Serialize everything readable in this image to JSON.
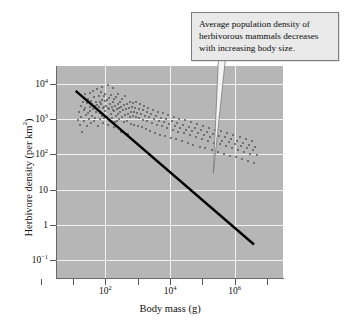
{
  "figure": {
    "background_color": "#ffffff",
    "plot_background_color": "#b6b6b6",
    "gridline_color": "#f2f2f2",
    "point_color": "#585858",
    "trendline_color": "#000000",
    "annotation_fill": "#e9e9e9",
    "annotation_border": "#7d7d7d"
  },
  "annotation": {
    "text": "Average population density of herbivorous mammals decreases with increasing body size.",
    "line1": "Average population density of",
    "line2": "herbivorous mammals decreases",
    "line3": "with increasing body size."
  },
  "axes": {
    "x_title": "Body mass (g)",
    "y_title_main": "Herbivore density (per km",
    "y_title_sup": "2",
    "y_title_close": ")",
    "y_title_full": "Herbivore density (per km²)"
  },
  "chart_data": {
    "type": "scatter",
    "title": "",
    "subtitle": "",
    "xlabel": "Body mass (g)",
    "ylabel": "Herbivore density (per km²)",
    "xscale": "log",
    "yscale": "log",
    "xlim": [
      3.1623,
      31622776.6
    ],
    "ylim": [
      0.0316,
      31622.8
    ],
    "grid": true,
    "legend": null,
    "legend_position": "none",
    "x_tick_labels": [
      "",
      "10²",
      "",
      "10⁴",
      "",
      "10⁶"
    ],
    "x_tick_values": [
      1,
      100,
      10000,
      1000000
    ],
    "x_tick_labeled": [
      {
        "value": 100,
        "label_base": "10",
        "label_exp": "2"
      },
      {
        "value": 10000,
        "label_base": "10",
        "label_exp": "4"
      },
      {
        "value": 1000000,
        "label_base": "10",
        "label_exp": "6"
      }
    ],
    "y_tick_labels": [
      {
        "value": 10000,
        "label_base": "10",
        "label_exp": "4"
      },
      {
        "value": 1000,
        "label_base": "10",
        "label_exp": "3"
      },
      {
        "value": 100,
        "label_base": "10",
        "label_exp": "2"
      },
      {
        "value": 10,
        "label_base": "10",
        "label_exp": ""
      },
      {
        "value": 1,
        "label_base": "1",
        "label_exp": ""
      },
      {
        "value": 0.1,
        "label_base": "10",
        "label_exp": "−1"
      }
    ],
    "trendline": {
      "type": "linear-in-log-log",
      "x_start": 12,
      "y_start": 6300,
      "x_end": 4000000,
      "y_end": 0.28,
      "slope_log10": -0.752,
      "description": "Average population density of herbivorous mammals decreases with increasing body size."
    },
    "annotations": [
      {
        "text": "Average population density of herbivorous mammals decreases with increasing body size.",
        "target_x": 220000,
        "target_y": 30
      }
    ],
    "n_points": 210,
    "points": [
      [
        14,
        950
      ],
      [
        15,
        1600
      ],
      [
        16,
        700
      ],
      [
        17,
        2400
      ],
      [
        18,
        1150
      ],
      [
        19,
        420
      ],
      [
        20,
        3100
      ],
      [
        21,
        1800
      ],
      [
        22,
        890
      ],
      [
        23,
        2050
      ],
      [
        24,
        5200
      ],
      [
        25,
        1300
      ],
      [
        26,
        640
      ],
      [
        27,
        2800
      ],
      [
        28,
        1450
      ],
      [
        29,
        3600
      ],
      [
        30,
        980
      ],
      [
        32,
        2200
      ],
      [
        33,
        5600
      ],
      [
        34,
        1700
      ],
      [
        35,
        760
      ],
      [
        36,
        3300
      ],
      [
        38,
        1250
      ],
      [
        39,
        2600
      ],
      [
        40,
        6100
      ],
      [
        42,
        1900
      ],
      [
        43,
        880
      ],
      [
        45,
        4200
      ],
      [
        46,
        2300
      ],
      [
        48,
        1100
      ],
      [
        50,
        3100
      ],
      [
        52,
        1600
      ],
      [
        54,
        7200
      ],
      [
        56,
        2450
      ],
      [
        58,
        620
      ],
      [
        60,
        1750
      ],
      [
        62,
        4400
      ],
      [
        64,
        2150
      ],
      [
        66,
        980
      ],
      [
        68,
        3050
      ],
      [
        70,
        1500
      ],
      [
        72,
        5800
      ],
      [
        74,
        2600
      ],
      [
        76,
        1200
      ],
      [
        78,
        3400
      ],
      [
        80,
        8100
      ],
      [
        82,
        2000
      ],
      [
        85,
        760
      ],
      [
        88,
        4600
      ],
      [
        90,
        2250
      ],
      [
        92,
        1050
      ],
      [
        95,
        3200
      ],
      [
        98,
        1650
      ],
      [
        100,
        5100
      ],
      [
        104,
        2400
      ],
      [
        108,
        1150
      ],
      [
        112,
        3500
      ],
      [
        116,
        9200
      ],
      [
        120,
        2100
      ],
      [
        124,
        690
      ],
      [
        128,
        4000
      ],
      [
        132,
        1950
      ],
      [
        136,
        880
      ],
      [
        140,
        2750
      ],
      [
        145,
        1400
      ],
      [
        150,
        4900
      ],
      [
        155,
        2250
      ],
      [
        160,
        1050
      ],
      [
        165,
        3100
      ],
      [
        170,
        7400
      ],
      [
        175,
        1800
      ],
      [
        180,
        600
      ],
      [
        185,
        3600
      ],
      [
        190,
        1700
      ],
      [
        196,
        820
      ],
      [
        202,
        2400
      ],
      [
        208,
        1250
      ],
      [
        214,
        4300
      ],
      [
        220,
        1950
      ],
      [
        228,
        900
      ],
      [
        236,
        2700
      ],
      [
        244,
        1400
      ],
      [
        252,
        5200
      ],
      [
        260,
        2100
      ],
      [
        270,
        980
      ],
      [
        280,
        3000
      ],
      [
        290,
        1600
      ],
      [
        300,
        430
      ],
      [
        310,
        2200
      ],
      [
        320,
        1150
      ],
      [
        335,
        3800
      ],
      [
        350,
        1750
      ],
      [
        365,
        820
      ],
      [
        380,
        2500
      ],
      [
        395,
        1300
      ],
      [
        410,
        4500
      ],
      [
        430,
        1900
      ],
      [
        450,
        870
      ],
      [
        470,
        2600
      ],
      [
        490,
        1400
      ],
      [
        510,
        380
      ],
      [
        530,
        2100
      ],
      [
        555,
        1150
      ],
      [
        580,
        3100
      ],
      [
        605,
        1600
      ],
      [
        630,
        740
      ],
      [
        660,
        2200
      ],
      [
        690,
        1250
      ],
      [
        720,
        2900
      ],
      [
        750,
        1550
      ],
      [
        790,
        700
      ],
      [
        830,
        2050
      ],
      [
        870,
        1120
      ],
      [
        910,
        3000
      ],
      [
        950,
        1450
      ],
      [
        1000,
        620
      ],
      [
        1060,
        1900
      ],
      [
        1120,
        1050
      ],
      [
        1190,
        2600
      ],
      [
        1260,
        1350
      ],
      [
        1340,
        580
      ],
      [
        1420,
        1750
      ],
      [
        1500,
        960
      ],
      [
        1600,
        2400
      ],
      [
        1700,
        1250
      ],
      [
        1800,
        510
      ],
      [
        1900,
        1550
      ],
      [
        2000,
        880
      ],
      [
        2150,
        2100
      ],
      [
        2300,
        1150
      ],
      [
        2450,
        460
      ],
      [
        2600,
        1400
      ],
      [
        2800,
        790
      ],
      [
        3000,
        1850
      ],
      [
        3200,
        1020
      ],
      [
        3400,
        410
      ],
      [
        3600,
        1250
      ],
      [
        3900,
        700
      ],
      [
        4200,
        1600
      ],
      [
        4500,
        900
      ],
      [
        4800,
        365
      ],
      [
        5200,
        1100
      ],
      [
        5600,
        620
      ],
      [
        6000,
        1450
      ],
      [
        6500,
        800
      ],
      [
        7000,
        330
      ],
      [
        7600,
        980
      ],
      [
        8200,
        550
      ],
      [
        8900,
        1280
      ],
      [
        9600,
        710
      ],
      [
        10400,
        295
      ],
      [
        11200,
        870
      ],
      [
        12000,
        490
      ],
      [
        13000,
        1150
      ],
      [
        14000,
        630
      ],
      [
        15000,
        265
      ],
      [
        16500,
        780
      ],
      [
        18000,
        440
      ],
      [
        19500,
        1020
      ],
      [
        21000,
        560
      ],
      [
        23000,
        235
      ],
      [
        25000,
        690
      ],
      [
        27000,
        390
      ],
      [
        29500,
        910
      ],
      [
        32000,
        500
      ],
      [
        35000,
        210
      ],
      [
        38000,
        615
      ],
      [
        41000,
        345
      ],
      [
        45000,
        810
      ],
      [
        49000,
        445
      ],
      [
        53000,
        187
      ],
      [
        58000,
        545
      ],
      [
        63000,
        307
      ],
      [
        69000,
        720
      ],
      [
        75000,
        395
      ],
      [
        82000,
        166
      ],
      [
        89000,
        485
      ],
      [
        97000,
        273
      ],
      [
        106000,
        640
      ],
      [
        115000,
        352
      ],
      [
        125000,
        148
      ],
      [
        137000,
        430
      ],
      [
        149000,
        243
      ],
      [
        162000,
        570
      ],
      [
        177000,
        313
      ],
      [
        193000,
        131
      ],
      [
        210000,
        382
      ],
      [
        229000,
        216
      ],
      [
        250000,
        505
      ],
      [
        272000,
        278
      ],
      [
        297000,
        117
      ],
      [
        324000,
        339
      ],
      [
        353000,
        192
      ],
      [
        385000,
        449
      ],
      [
        420000,
        247
      ],
      [
        458000,
        104
      ],
      [
        500000,
        301
      ],
      [
        545000,
        170
      ],
      [
        594000,
        398
      ],
      [
        648000,
        219
      ],
      [
        707000,
        92
      ],
      [
        771000,
        267
      ],
      [
        841000,
        151
      ],
      [
        917000,
        353
      ],
      [
        1000000,
        194
      ],
      [
        1090000,
        82
      ],
      [
        1190000,
        237
      ],
      [
        1300000,
        134
      ],
      [
        1420000,
        313
      ],
      [
        1550000,
        172
      ],
      [
        1690000,
        73
      ],
      [
        1840000,
        210
      ],
      [
        2010000,
        119
      ],
      [
        2190000,
        278
      ],
      [
        2390000,
        153
      ],
      [
        2610000,
        65
      ],
      [
        2850000,
        186
      ],
      [
        3100000,
        105
      ],
      [
        3400000,
        247
      ],
      [
        3700000,
        136
      ],
      [
        4000000,
        58
      ],
      [
        4400000,
        165
      ],
      [
        4800000,
        93
      ]
    ]
  }
}
